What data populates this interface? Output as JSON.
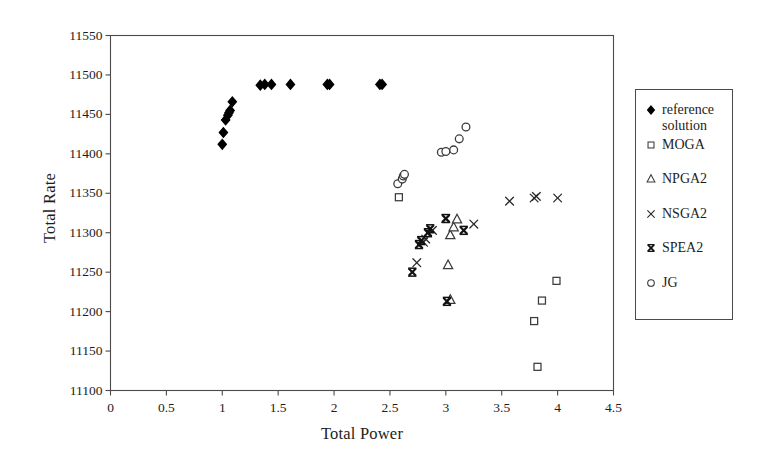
{
  "chart_data": {
    "type": "scatter",
    "title": "",
    "xlabel": "Total Power",
    "ylabel": "Total Rate",
    "xlim": [
      0,
      4.5
    ],
    "ylim": [
      11100,
      11550
    ],
    "xticks": [
      "0",
      "0.5",
      "1",
      "1.5",
      "2",
      "2.5",
      "3",
      "3.5",
      "4",
      "4.5"
    ],
    "xtick_values": [
      0,
      0.5,
      1,
      1.5,
      2,
      2.5,
      3,
      3.5,
      4,
      4.5
    ],
    "yticks": [
      "11100",
      "11150",
      "11200",
      "11250",
      "11300",
      "11350",
      "11400",
      "11450",
      "11500",
      "11550"
    ],
    "ytick_values": [
      11100,
      11150,
      11200,
      11250,
      11300,
      11350,
      11400,
      11450,
      11500,
      11550
    ],
    "grid": false,
    "legend_position": "right-outside",
    "series": [
      {
        "name": "reference solution",
        "marker": "filled-diamond",
        "color": "#000000",
        "points": [
          [
            1.0,
            11412
          ],
          [
            1.01,
            11427
          ],
          [
            1.03,
            11443
          ],
          [
            1.05,
            11449
          ],
          [
            1.06,
            11452
          ],
          [
            1.07,
            11455
          ],
          [
            1.09,
            11466
          ],
          [
            1.34,
            11487
          ],
          [
            1.38,
            11488
          ],
          [
            1.44,
            11488
          ],
          [
            1.61,
            11488
          ],
          [
            1.94,
            11488
          ],
          [
            1.96,
            11488
          ],
          [
            2.41,
            11488
          ],
          [
            2.43,
            11488
          ]
        ]
      },
      {
        "name": "MOGA",
        "marker": "open-square",
        "color": "#3c3c3c",
        "points": [
          [
            2.58,
            11345
          ],
          [
            3.82,
            11130
          ],
          [
            3.79,
            11188
          ],
          [
            3.86,
            11214
          ],
          [
            3.99,
            11239
          ]
        ]
      },
      {
        "name": "NPGA2",
        "marker": "open-triangle",
        "color": "#3c3c3c",
        "points": [
          [
            3.04,
            11215
          ],
          [
            3.02,
            11259
          ],
          [
            3.04,
            11297
          ],
          [
            3.07,
            11307
          ],
          [
            3.1,
            11317
          ]
        ]
      },
      {
        "name": "NSGA2",
        "marker": "x-cross",
        "color": "#2a2a2a",
        "points": [
          [
            2.74,
            11262
          ],
          [
            2.8,
            11288
          ],
          [
            2.82,
            11292
          ],
          [
            2.88,
            11303
          ],
          [
            3.0,
            11318
          ],
          [
            3.25,
            11311
          ],
          [
            3.57,
            11340
          ],
          [
            3.79,
            11344
          ],
          [
            3.81,
            11346
          ],
          [
            4.0,
            11344
          ]
        ]
      },
      {
        "name": "SPEA2",
        "marker": "bold-x",
        "color": "#111111",
        "points": [
          [
            2.7,
            11250
          ],
          [
            2.76,
            11285
          ],
          [
            2.78,
            11290
          ],
          [
            2.84,
            11300
          ],
          [
            2.86,
            11305
          ],
          [
            3.01,
            11213
          ],
          [
            3.0,
            11318
          ],
          [
            3.16,
            11303
          ]
        ]
      },
      {
        "name": "JG",
        "marker": "open-circle",
        "color": "#3c3c3c",
        "points": [
          [
            2.57,
            11362
          ],
          [
            2.61,
            11368
          ],
          [
            2.62,
            11372
          ],
          [
            2.63,
            11374
          ],
          [
            2.96,
            11402
          ],
          [
            3.0,
            11403
          ],
          [
            3.07,
            11405
          ],
          [
            3.12,
            11419
          ],
          [
            3.18,
            11434
          ]
        ]
      }
    ]
  },
  "legend": {
    "items": [
      {
        "label": "reference solution",
        "marker": "filled-diamond"
      },
      {
        "label": "MOGA",
        "marker": "open-square"
      },
      {
        "label": "NPGA2",
        "marker": "open-triangle"
      },
      {
        "label": "NSGA2",
        "marker": "x-cross"
      },
      {
        "label": "SPEA2",
        "marker": "bold-x"
      },
      {
        "label": "JG",
        "marker": "open-circle"
      }
    ]
  },
  "axes": {
    "x_title": "Total Power",
    "y_title": "Total Rate"
  }
}
